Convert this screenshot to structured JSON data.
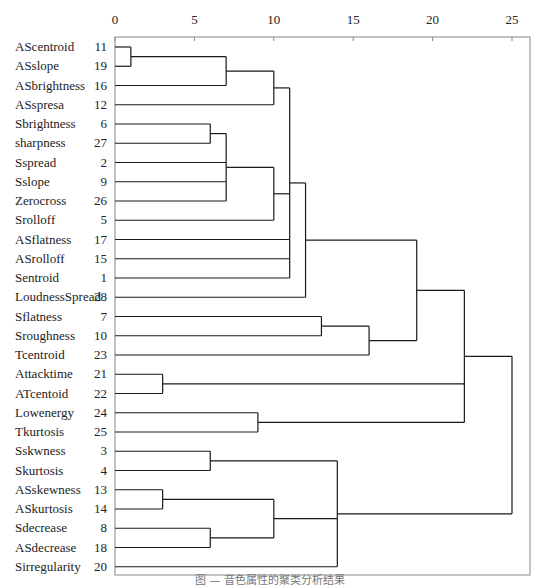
{
  "chart_data": {
    "type": "dendrogram",
    "title": "",
    "xlabel": "",
    "ylabel": "",
    "x_ticks": [
      0,
      5,
      10,
      15,
      20,
      25
    ],
    "xlim": [
      0,
      26
    ],
    "grid": false,
    "legend": null,
    "leaves": [
      {
        "name": "AScentroid",
        "id": 11
      },
      {
        "name": "ASslope",
        "id": 19
      },
      {
        "name": "ASbrightness",
        "id": 16
      },
      {
        "name": "ASspresa",
        "id": 12
      },
      {
        "name": "Sbrightness",
        "id": 6
      },
      {
        "name": "sharpness",
        "id": 27
      },
      {
        "name": "Sspread",
        "id": 2
      },
      {
        "name": "Sslope",
        "id": 9
      },
      {
        "name": "Zerocross",
        "id": 26
      },
      {
        "name": "Srolloff",
        "id": 5
      },
      {
        "name": "ASflatness",
        "id": 17
      },
      {
        "name": "ASrolloff",
        "id": 15
      },
      {
        "name": "Sentroid",
        "id": 1
      },
      {
        "name": "LoudnessSpread",
        "id": 28
      },
      {
        "name": "Sflatness",
        "id": 7
      },
      {
        "name": "Sroughness",
        "id": 10
      },
      {
        "name": "Tcentroid",
        "id": 23
      },
      {
        "name": "Attacktime",
        "id": 21
      },
      {
        "name": "ATcentoid",
        "id": 22
      },
      {
        "name": "Lowenergy",
        "id": 24
      },
      {
        "name": "Tkurtosis",
        "id": 25
      },
      {
        "name": "Sskwness",
        "id": 3
      },
      {
        "name": "Skurtosis",
        "id": 4
      },
      {
        "name": "ASskewness",
        "id": 13
      },
      {
        "name": "ASkurtosis",
        "id": 14
      },
      {
        "name": "Sdecrease",
        "id": 8
      },
      {
        "name": "ASdecrease",
        "id": 18
      },
      {
        "name": "Sirregularity",
        "id": 20
      }
    ],
    "merges": [
      {
        "id": "A",
        "children": [
          0,
          1
        ],
        "height": 1.0
      },
      {
        "id": "B",
        "children": [
          "A",
          2
        ],
        "height": 7.0
      },
      {
        "id": "C",
        "children": [
          4,
          5
        ],
        "height": 6.0
      },
      {
        "id": "D",
        "children": [
          "C",
          6,
          7,
          8
        ],
        "height": 7.0
      },
      {
        "id": "E",
        "children": [
          "B",
          3
        ],
        "height": 10.0
      },
      {
        "id": "F",
        "children": [
          "D",
          9
        ],
        "height": 10.0
      },
      {
        "id": "G",
        "children": [
          "E",
          "F",
          10,
          11,
          12
        ],
        "height": 11.0
      },
      {
        "id": "H",
        "children": [
          "G",
          13
        ],
        "height": 12.0
      },
      {
        "id": "I",
        "children": [
          14,
          15
        ],
        "height": 13.0
      },
      {
        "id": "J",
        "children": [
          "I",
          16
        ],
        "height": 16.0
      },
      {
        "id": "K",
        "children": [
          "H",
          "J"
        ],
        "height": 19.0
      },
      {
        "id": "L",
        "children": [
          17,
          18
        ],
        "height": 3.0
      },
      {
        "id": "M",
        "children": [
          19,
          20
        ],
        "height": 9.0
      },
      {
        "id": "N",
        "children": [
          "K",
          "L",
          "M"
        ],
        "height": 22.0
      },
      {
        "id": "O",
        "children": [
          21,
          22
        ],
        "height": 6.0
      },
      {
        "id": "P",
        "children": [
          23,
          24
        ],
        "height": 3.0
      },
      {
        "id": "Q",
        "children": [
          25,
          26
        ],
        "height": 6.0
      },
      {
        "id": "R",
        "children": [
          "P",
          "Q"
        ],
        "height": 10.0
      },
      {
        "id": "S",
        "children": [
          "O",
          "R",
          27
        ],
        "height": 14.0
      },
      {
        "id": "T",
        "children": [
          "N",
          "S"
        ],
        "height": 25.0
      }
    ]
  },
  "caption": "图 — 音色属性的聚类分析结果",
  "style": {
    "line_color": "#1a1a1a",
    "frame_color": "#888888",
    "caption_color": "#777777"
  }
}
